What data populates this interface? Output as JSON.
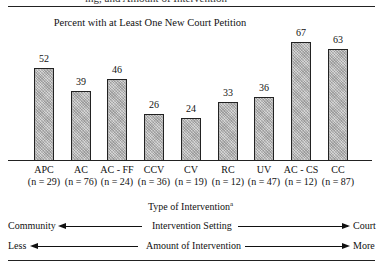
{
  "header": {
    "cut_text": "ing, and Amount of Intervention"
  },
  "chart_data": {
    "type": "bar",
    "title": "Percent with at Least One New Court Petition",
    "xlabel": "Type of Intervention",
    "xlabel_superscript": "a",
    "ylabel": "",
    "ylim": [
      0,
      100
    ],
    "grid": false,
    "categories": [
      "APC",
      "AC",
      "AC - FF",
      "CCV",
      "CV",
      "RC",
      "UV",
      "AC - CS",
      "CC"
    ],
    "sample_sizes": [
      "(n = 29)",
      "(n = 76)",
      "(n = 24)",
      "(n = 36)",
      "(n = 19)",
      "(n = 12)",
      "(n = 47)",
      "(n = 12)",
      "(n = 87)"
    ],
    "values": [
      52,
      39,
      46,
      26,
      24,
      33,
      36,
      67,
      63
    ],
    "value_labels": [
      "52",
      "39",
      "46",
      "26",
      "24",
      "33",
      "36",
      "67",
      "63"
    ]
  },
  "scales": {
    "setting": {
      "left": "Community",
      "center": "Intervention Setting",
      "right": "Court"
    },
    "amount": {
      "left": "Less",
      "center": "Amount of Intervention",
      "right": "More"
    }
  }
}
